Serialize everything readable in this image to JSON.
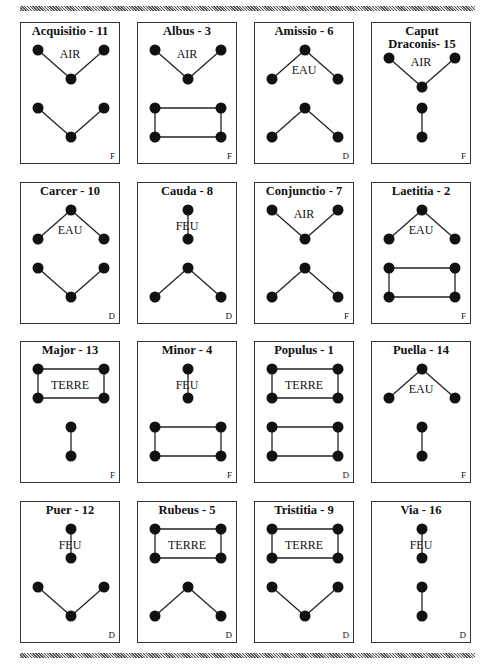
{
  "page": {
    "heading_partial": "p p"
  },
  "cards": [
    {
      "title": "Acquisitio - 11",
      "element": "AIR",
      "badge": "F",
      "top": "air",
      "bottom": "vee"
    },
    {
      "title": "Albus - 3",
      "element": "AIR",
      "badge": "F",
      "top": "air",
      "bottom": "rect"
    },
    {
      "title": "Amissio - 6",
      "element": "EAU",
      "badge": "D",
      "top": "eau",
      "bottom": "caret"
    },
    {
      "title": "Caput Draconis- 15",
      "element": "AIR",
      "badge": "F",
      "top": "air",
      "bottom": "stick"
    },
    {
      "title": "Carcer - 10",
      "element": "EAU",
      "badge": "D",
      "top": "eau",
      "bottom": "vee"
    },
    {
      "title": "Cauda - 8",
      "element": "FEU",
      "badge": "D",
      "top": "feu",
      "bottom": "caret"
    },
    {
      "title": "Conjunctio - 7",
      "element": "AIR",
      "badge": "F",
      "top": "air",
      "bottom": "caret"
    },
    {
      "title": "Laetitia - 2",
      "element": "EAU",
      "badge": "F",
      "top": "eau",
      "bottom": "rect"
    },
    {
      "title": "Major - 13",
      "element": "TERRE",
      "badge": "F",
      "top": "terre",
      "bottom": "stick"
    },
    {
      "title": "Minor - 4",
      "element": "FEU",
      "badge": "F",
      "top": "feu",
      "bottom": "rect"
    },
    {
      "title": "Populus - 1",
      "element": "TERRE",
      "badge": "D",
      "top": "terre",
      "bottom": "rect"
    },
    {
      "title": "Puella - 14",
      "element": "EAU",
      "badge": "F",
      "top": "eau",
      "bottom": "stick"
    },
    {
      "title": "Puer - 12",
      "element": "FEU",
      "badge": "D",
      "top": "feu",
      "bottom": "vee"
    },
    {
      "title": "Rubeus - 5",
      "element": "TERRE",
      "badge": "D",
      "top": "terre",
      "bottom": "caret"
    },
    {
      "title": "Tristitia - 9",
      "element": "TERRE",
      "badge": "D",
      "top": "terre",
      "bottom": "vee"
    },
    {
      "title": "Via - 16",
      "element": "FEU",
      "badge": "D",
      "top": "feu",
      "bottom": "stick"
    }
  ]
}
